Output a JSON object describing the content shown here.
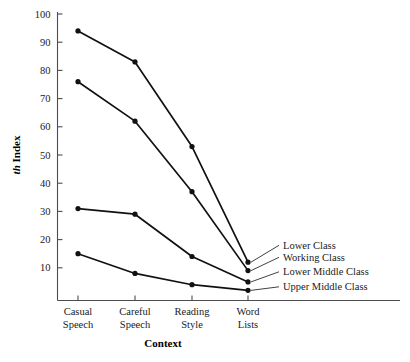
{
  "chart_data": {
    "type": "line",
    "title": "",
    "xlabel": "Context",
    "ylabel": "th Index",
    "ylabel_italic_prefix": "th",
    "ylabel_rest": " Index",
    "categories": [
      "Casual Speech",
      "Careful Speech",
      "Reading Style",
      "Word Lists"
    ],
    "category_lines": [
      [
        "Casual",
        "Speech"
      ],
      [
        "Careful",
        "Speech"
      ],
      [
        "Reading",
        "Style"
      ],
      [
        "Word",
        "Lists"
      ]
    ],
    "ylim": [
      0,
      100
    ],
    "yticks": [
      10,
      20,
      30,
      40,
      50,
      60,
      70,
      80,
      90,
      100
    ],
    "ytick_labels": [
      "10",
      "20",
      "30",
      "40",
      "50",
      "60",
      "70",
      "80",
      "90",
      "100"
    ],
    "grid": false,
    "legend_position": "right-inline-labels",
    "series": [
      {
        "name": "Lower Class",
        "values": [
          94,
          83,
          53,
          12
        ]
      },
      {
        "name": "Working Class",
        "values": [
          76,
          62,
          37,
          9
        ]
      },
      {
        "name": "Lower Middle Class",
        "values": [
          31,
          29,
          14,
          5
        ]
      },
      {
        "name": "Upper Middle Class",
        "values": [
          15,
          8,
          4,
          2
        ]
      }
    ],
    "marker": "filled-circle",
    "line_color": "#111111",
    "marker_color": "#111111",
    "axis_color": "#4d4d4d",
    "background_color": "#ffffff"
  }
}
